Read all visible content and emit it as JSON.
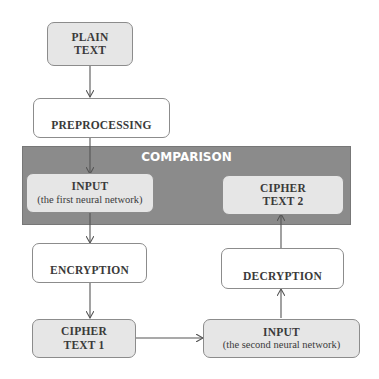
{
  "diagram": {
    "panel": {
      "title": "COMPARISON",
      "color": "#8b8b8b"
    },
    "nodes": {
      "plain_text": {
        "line1": "PLAIN",
        "line2": "TEXT"
      },
      "preprocessing": {
        "label": "PREPROCESSING"
      },
      "input1": {
        "title": "INPUT",
        "subtitle": "(the first neural network)"
      },
      "cipher_text_2": {
        "line1": "CIPHER",
        "line2": "TEXT 2"
      },
      "encryption": {
        "label": "ENCRYPTION"
      },
      "decryption": {
        "label": "DECRYPTION"
      },
      "cipher_text_1": {
        "line1": "CIPHER",
        "line2": "TEXT 1"
      },
      "input2": {
        "title": "INPUT",
        "subtitle": "(the second neural network)"
      }
    },
    "edges": [
      {
        "from": "PLAIN TEXT",
        "to": "PREPROCESSING"
      },
      {
        "from": "PREPROCESSING",
        "to": "INPUT (the first neural network)"
      },
      {
        "from": "INPUT (the first neural network)",
        "to": "ENCRYPTION"
      },
      {
        "from": "ENCRYPTION",
        "to": "CIPHER TEXT 1"
      },
      {
        "from": "CIPHER TEXT 1",
        "to": "INPUT (the second neural network)"
      },
      {
        "from": "INPUT (the second neural network)",
        "to": "DECRYPTION"
      },
      {
        "from": "DECRYPTION",
        "to": "CIPHER TEXT 2"
      }
    ],
    "colors": {
      "shaded_box": "#e6e6e6",
      "border": "#8c8c8c",
      "arrow": "#555555",
      "text": "#3a3a3a"
    }
  }
}
